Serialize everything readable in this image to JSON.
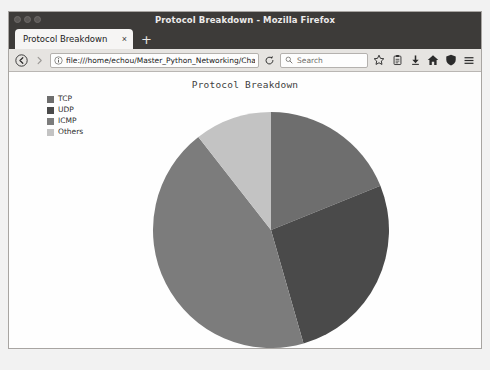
{
  "window": {
    "title": "Protocol Breakdown - Mozilla Firefox",
    "minimize_icon": "minimize-icon",
    "maximize_icon": "maximize-icon",
    "close_icon": "close-icon"
  },
  "tabs": [
    {
      "label": "Protocol Breakdown",
      "close_label": "×"
    }
  ],
  "new_tab_label": "+",
  "toolbar": {
    "back_icon": "back-arrow-icon",
    "forward_icon": "forward-arrow-icon",
    "identity_icon": "page-info-icon",
    "url": "file:///home/echou/Master_Python_Networking/Chap",
    "reload_icon": "reload-icon",
    "search_icon": "search-icon",
    "search_placeholder": "Search",
    "bookmark_icon": "star-icon",
    "library_icon": "library-icon",
    "downloads_icon": "download-arrow-icon",
    "home_icon": "home-icon",
    "shield_icon": "shield-icon",
    "menu_icon": "hamburger-menu-icon"
  },
  "colors": {
    "tcp": "#6e6e6e",
    "udp": "#4a4a4a",
    "icmp": "#7c7c7c",
    "others": "#c3c3c3",
    "page_background": "#fefefe",
    "title_text": "#3f3f3f"
  },
  "chart_data": {
    "type": "pie",
    "title": "Protocol Breakdown",
    "xlabel": "",
    "ylabel": "",
    "categories": [
      "TCP",
      "UDP",
      "ICMP",
      "Others"
    ],
    "values": [
      19,
      27,
      44,
      10
    ],
    "unit": "percent",
    "start_angle_deg": 90,
    "direction": "clockwise",
    "legend_position": "upper-left",
    "grid": false,
    "slices": [
      {
        "label": "TCP",
        "value": 19,
        "color": "#6e6e6e",
        "start_deg": 0,
        "end_deg": 68
      },
      {
        "label": "UDP",
        "value": 27,
        "color": "#4a4a4a",
        "start_deg": 68,
        "end_deg": 164
      },
      {
        "label": "ICMP",
        "value": 44,
        "color": "#7c7c7c",
        "start_deg": 164,
        "end_deg": 322
      },
      {
        "label": "Others",
        "value": 10,
        "color": "#c3c3c3",
        "start_deg": 322,
        "end_deg": 360
      }
    ]
  }
}
